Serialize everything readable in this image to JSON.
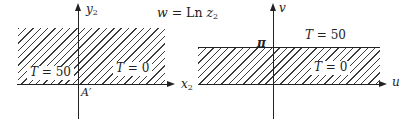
{
  "title": {
    "w": "w",
    "eq": " = Ln ",
    "z": "z",
    "sub": "2"
  },
  "left_diagram": {
    "y_axis_label": {
      "base": "y",
      "sub": "2"
    },
    "x_axis_label": {
      "base": "x",
      "sub": "2"
    },
    "origin_label": "A′",
    "region_labels": {
      "t50": {
        "var": "T",
        "rest": " = 50"
      },
      "t0": {
        "var": "T",
        "rest": " = 0"
      }
    }
  },
  "right_diagram": {
    "v_axis_label": "v",
    "u_axis_label": "u",
    "pi_label": "π",
    "region_labels": {
      "t50": {
        "var": "T",
        "rest": " = 50"
      },
      "t0": {
        "var": "T",
        "rest": " = 0"
      }
    }
  },
  "colors": {
    "ink": "#222222",
    "hatch": "#3c3c3c",
    "background": "#ffffff"
  }
}
